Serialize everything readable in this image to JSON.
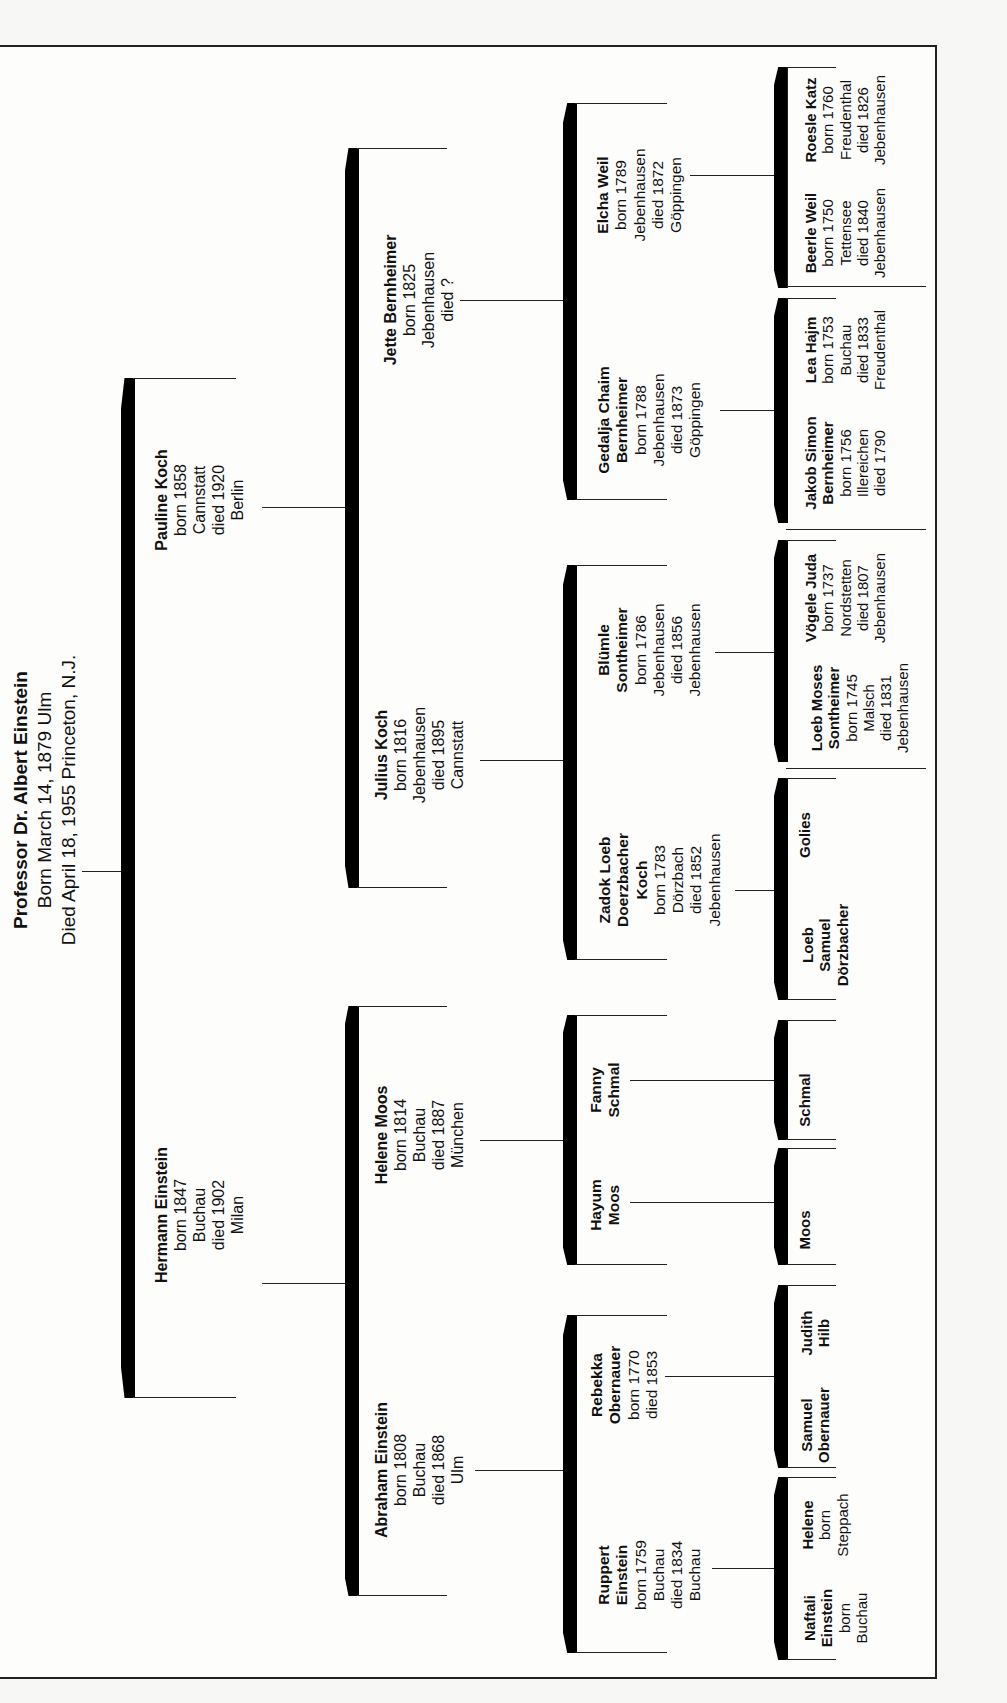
{
  "title": {
    "name": "Professor Dr. Albert Einstein",
    "born": "Born March 14, 1879 Ulm",
    "died": "Died April 18, 1955 Princeton, N.J."
  },
  "parents": [
    {
      "name": "Pauline Koch",
      "lines": [
        "born 1858",
        "Cannstatt",
        "died 1920",
        "Berlin"
      ]
    },
    {
      "name": "Hermann Einstein",
      "lines": [
        "born 1847",
        "Buchau",
        "died 1902",
        "Milan"
      ]
    }
  ],
  "grandparents": [
    {
      "name": "Jette Bernheimer",
      "lines": [
        "born 1825",
        "Jebenhausen",
        "died ?"
      ]
    },
    {
      "name": "Julius Koch",
      "lines": [
        "born 1816",
        "Jebenhausen",
        "died 1895",
        "Cannstatt"
      ]
    },
    {
      "name": "Helene Moos",
      "lines": [
        "born 1814",
        "Buchau",
        "died 1887",
        "München"
      ]
    },
    {
      "name": "Abraham Einstein",
      "lines": [
        "born 1808",
        "Buchau",
        "died 1868",
        "Ulm"
      ]
    }
  ],
  "great_grandparents": [
    {
      "name": "Elcha Weil",
      "lines": [
        "born 1789",
        "Jebenhausen",
        "died 1872",
        "Göppingen"
      ]
    },
    {
      "name": "Gedalja Chaim Bernheimer",
      "name_lines": [
        "Gedalja Chaim",
        "Bernheimer"
      ],
      "lines": [
        "born 1788",
        "Jebenhausen",
        "died 1873",
        "Göppingen"
      ]
    },
    {
      "name": "Blümle Sontheimer",
      "name_lines": [
        "Blümle",
        "Sontheimer"
      ],
      "lines": [
        "born 1786",
        "Jebenhausen",
        "died 1856",
        "Jebenhausen"
      ]
    },
    {
      "name": "Zadok Loeb Doerzbacher Koch",
      "name_lines": [
        "Zadok Loeb",
        "Doerzbacher",
        "Koch"
      ],
      "lines": [
        "born 1783",
        "Dörzbach",
        "died 1852",
        "Jebenhausen"
      ]
    },
    {
      "name": "Fanny Schmal",
      "name_lines": [
        "Fanny",
        "Schmal"
      ],
      "lines": []
    },
    {
      "name": "Hayum Moos",
      "name_lines": [
        "Hayum",
        "Moos"
      ],
      "lines": []
    },
    {
      "name": "Rebekka Obernauer",
      "name_lines": [
        "Rebekka",
        "Obernauer"
      ],
      "lines": [
        "born 1770",
        "died 1853"
      ]
    },
    {
      "name": "Ruppert Einstein",
      "name_lines": [
        "Ruppert",
        "Einstein"
      ],
      "lines": [
        "born 1759",
        "Buchau",
        "died 1834",
        "Buchau"
      ]
    }
  ],
  "great_great_grandparents": [
    {
      "name": "Roesle Katz",
      "name_lines": [
        "Roesle Katz"
      ],
      "lines": [
        "born 1760",
        "Freudenthal",
        "died 1826",
        "Jebenhausen"
      ]
    },
    {
      "name": "Beerle Weil",
      "name_lines": [
        "Beerle Weil"
      ],
      "lines": [
        "born 1750",
        "Tettensee",
        "died 1840",
        "Jebenhausen"
      ]
    },
    {
      "name": "Lea Hajm",
      "name_lines": [
        "Lea Hajm"
      ],
      "lines": [
        "born 1753",
        "Buchau",
        "died 1833",
        "Freudenthal"
      ]
    },
    {
      "name": "Jakob Simon Bernheimer",
      "name_lines": [
        "Jakob Simon",
        "Bernheimer"
      ],
      "lines": [
        "born 1756",
        "Illereichen",
        "died 1790"
      ]
    },
    {
      "name": "Vögele Juda",
      "name_lines": [
        "Vögele Juda"
      ],
      "lines": [
        "born 1737",
        "Nordstetten",
        "died 1807",
        "Jebenhausen"
      ]
    },
    {
      "name": "Loeb Moses Sontheimer",
      "name_lines": [
        "Loeb Moses",
        "Sontheimer"
      ],
      "lines": [
        "born 1745",
        "Malsch",
        "died 1831",
        "Jebenhausen"
      ]
    },
    {
      "name": "Golies",
      "name_lines": [
        "Golies"
      ],
      "lines": []
    },
    {
      "name": "Loeb Samuel Dörzbacher",
      "name_lines": [
        "Loeb",
        "Samuel",
        "Dörzbacher"
      ],
      "lines": []
    },
    {
      "name": "Schmal",
      "name_lines": [
        "Schmal"
      ],
      "lines": []
    },
    {
      "name": "Moos",
      "name_lines": [
        "Moos"
      ],
      "lines": []
    },
    {
      "name": "Judith Hilb",
      "name_lines": [
        "Judith",
        "Hilb"
      ],
      "lines": []
    },
    {
      "name": "Samuel Obernauer",
      "name_lines": [
        "Samuel",
        "Obernauer"
      ],
      "lines": []
    },
    {
      "name": "Helene",
      "name_lines": [
        "Helene"
      ],
      "lines": [
        "born",
        "Steppach"
      ]
    },
    {
      "name": "Naftali Einstein",
      "name_lines": [
        "Naftali",
        "Einstein"
      ],
      "lines": [
        "born",
        "Buchau"
      ]
    }
  ]
}
